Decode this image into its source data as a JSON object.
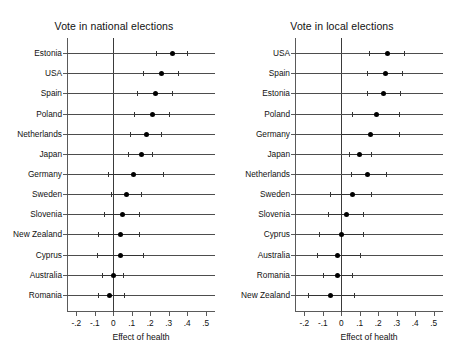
{
  "figure": {
    "width": 456,
    "height": 364,
    "background": "#ffffff",
    "foreground": "#111111"
  },
  "chart_data": [
    {
      "type": "scatter",
      "panel_id": "national",
      "title": "Vote in national elections",
      "xlabel": "Effect of health",
      "ylabel": "",
      "xlim": [
        -0.25,
        0.55
      ],
      "xticks": [
        -0.2,
        -0.1,
        0,
        0.1,
        0.2,
        0.3,
        0.4,
        0.5
      ],
      "xticklabels": [
        "-.2",
        "-.1",
        "0",
        ".1",
        ".2",
        ".3",
        ".4",
        ".5"
      ],
      "grid": false,
      "reference_line": 0,
      "legend": "none",
      "categories": [
        "Estonia",
        "USA",
        "Spain",
        "Poland",
        "Netherlands",
        "Japan",
        "Germany",
        "Sweden",
        "Slovenia",
        "New Zealand",
        "Cyprus",
        "Australia",
        "Romania"
      ],
      "values": [
        0.32,
        0.26,
        0.23,
        0.21,
        0.18,
        0.15,
        0.11,
        0.07,
        0.05,
        0.04,
        0.04,
        0.0,
        -0.02
      ],
      "ci_low": [
        0.23,
        0.16,
        0.13,
        0.11,
        0.09,
        0.08,
        -0.03,
        -0.01,
        -0.05,
        -0.08,
        -0.09,
        -0.06,
        -0.08
      ],
      "ci_high": [
        0.4,
        0.35,
        0.32,
        0.3,
        0.26,
        0.21,
        0.27,
        0.15,
        0.14,
        0.14,
        0.16,
        0.05,
        0.06
      ]
    },
    {
      "type": "scatter",
      "panel_id": "local",
      "title": "Vote in local elections",
      "xlabel": "Effect of health",
      "ylabel": "",
      "xlim": [
        -0.25,
        0.55
      ],
      "xticks": [
        -0.2,
        -0.1,
        0,
        0.1,
        0.2,
        0.3,
        0.4,
        0.5
      ],
      "xticklabels": [
        "-.2",
        "-.1",
        "0",
        ".1",
        ".2",
        ".3",
        ".4",
        ".5"
      ],
      "grid": false,
      "reference_line": 0,
      "legend": "none",
      "categories": [
        "USA",
        "Spain",
        "Estonia",
        "Poland",
        "Germany",
        "Japan",
        "Netherlands",
        "Sweden",
        "Slovenia",
        "Cyprus",
        "Australia",
        "Romania",
        "New Zealand"
      ],
      "values": [
        0.25,
        0.24,
        0.23,
        0.19,
        0.16,
        0.1,
        0.14,
        0.06,
        0.03,
        0.0,
        -0.02,
        -0.02,
        -0.06
      ],
      "ci_low": [
        0.15,
        0.14,
        0.14,
        0.06,
        0.0,
        0.04,
        0.05,
        -0.06,
        -0.07,
        -0.12,
        -0.13,
        -0.1,
        -0.18
      ],
      "ci_high": [
        0.34,
        0.33,
        0.32,
        0.31,
        0.31,
        0.16,
        0.24,
        0.16,
        0.12,
        0.12,
        0.1,
        0.06,
        0.07
      ]
    }
  ]
}
